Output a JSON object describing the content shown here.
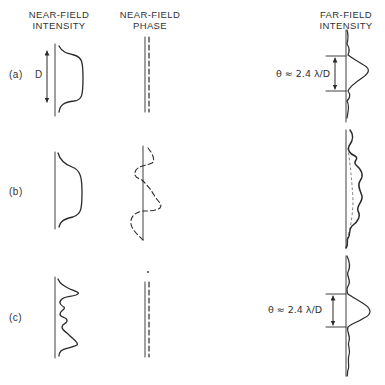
{
  "headers": {
    "near_field_intensity": [
      "NEAR-FIELD",
      "INTENSITY"
    ],
    "near_field_phase": [
      "NEAR-FIELD",
      "PHASE"
    ],
    "far_field_intensity": [
      "FAR-FIELD",
      "INTENSITY"
    ]
  },
  "rows": [
    {
      "label": "(a)",
      "aperture_label": "D",
      "far_field_annotation": "θ ≈ 2.4 λ/D"
    },
    {
      "label": "(b)"
    },
    {
      "label": "(c)",
      "far_field_annotation": "θ ≈ 2.4 λ/D"
    }
  ],
  "colors": {
    "ink": "#2a2a2a",
    "background": "#ffffff"
  }
}
